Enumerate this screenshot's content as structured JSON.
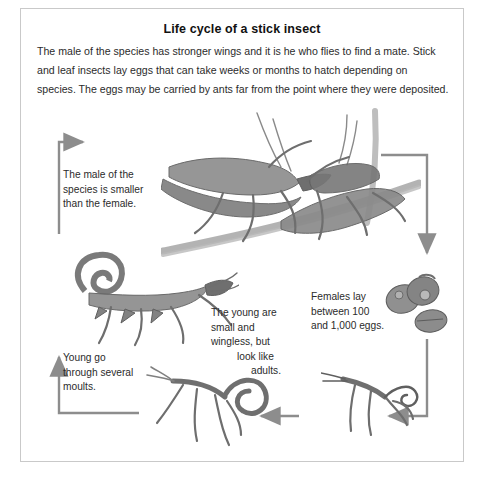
{
  "page": {
    "title": "Life cycle of a stick insect",
    "intro": "The male of the species has stronger wings and it is he who flies to find a mate. Stick and leaf insects lay eggs that can take weeks or months to hatch depending on species. The eggs may be carried by ants far from the point where they were deposited.",
    "border_color": "#c9c9c9",
    "background": "#ffffff",
    "text_color": "#2b2b2b"
  },
  "diagram": {
    "type": "life-cycle",
    "arrow_color": "#8d8d8d",
    "notes": [
      {
        "id": "male-size",
        "text": "The male of the species is smaller than the female."
      },
      {
        "id": "young-moults",
        "text": "Young go through several moults."
      },
      {
        "id": "young-wingless",
        "line1": "The young",
        "line2": "are small and",
        "line3": "wingless, but",
        "line4": "look like",
        "line5": "adults."
      },
      {
        "id": "eggs-count",
        "text": "Females lay between 100 and 1,000 eggs."
      }
    ],
    "stages": [
      {
        "id": "mating-adults",
        "label": "Mating adult stick insects on a branch"
      },
      {
        "id": "adult-female",
        "label": "Adult female stick insect"
      },
      {
        "id": "eggs",
        "label": "Stick insect eggs"
      },
      {
        "id": "nymph-right",
        "label": "Young nymph"
      },
      {
        "id": "nymph-left",
        "label": "Young nymph moulting"
      }
    ],
    "arrows": [
      {
        "id": "arrow-up-to-adults",
        "direction": "right"
      },
      {
        "id": "arrow-adults-to-eggs",
        "direction": "down"
      },
      {
        "id": "arrow-eggs-to-nymph",
        "direction": "left"
      },
      {
        "id": "arrow-nymph-to-nymph",
        "direction": "left"
      },
      {
        "id": "arrow-nymph-to-adult",
        "direction": "up"
      }
    ]
  }
}
